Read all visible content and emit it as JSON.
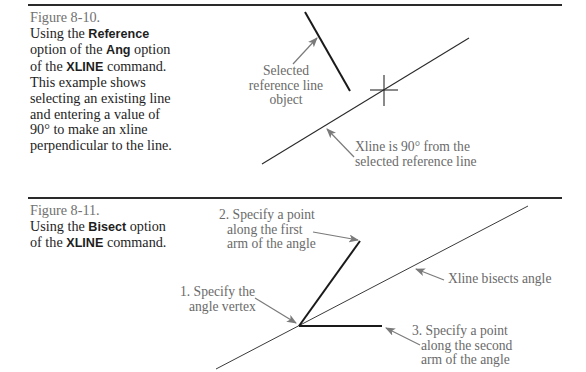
{
  "figures": [
    {
      "number": "Figure 8-10.",
      "caption": {
        "t1": "Using the ",
        "b1": "Reference",
        "t2": "option of the ",
        "b2": "Ang",
        "t3": "option of the ",
        "b3": "XLINE",
        "t4": "command. This example shows selecting an existing line and entering a value of 90° to make an xline perpendicular to the line."
      },
      "labels": {
        "reference": [
          "Selected",
          "reference line",
          "object"
        ],
        "xline": [
          "Xline is 90° from the",
          "selected reference line"
        ]
      }
    },
    {
      "number": "Figure 8-11.",
      "caption": {
        "t1": "Using the ",
        "b1": "Bisect",
        "t2": "option of the ",
        "b2": "XLINE",
        "t3": "command."
      },
      "labels": {
        "step1": [
          "1. Specify the",
          "angle vertex"
        ],
        "step2": [
          "2. Specify a point",
          "along the first",
          "arm of the angle"
        ],
        "step3": [
          "3. Specify a point",
          "along the second",
          "arm of the angle"
        ],
        "bisect": [
          "Xline bisects angle"
        ]
      }
    }
  ],
  "colors": {
    "rule": "#2a2a2a",
    "line": "#1a1a1a",
    "leader": "#7a7a7a",
    "label": "#6a6a6a"
  }
}
